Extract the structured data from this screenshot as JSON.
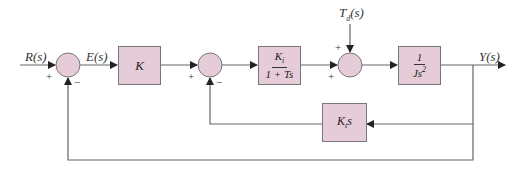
{
  "diagram": {
    "type": "block-diagram",
    "signals": {
      "input": "R(s)",
      "error": "E(s)",
      "disturbance": "T",
      "disturbance_sub": "d",
      "disturbance_arg": "(s)",
      "output": "Y(s)"
    },
    "blocks": {
      "gain": {
        "label": "K"
      },
      "controller": {
        "numerator": "K",
        "numerator_sub": "i",
        "denominator": "1 + Ts"
      },
      "plant": {
        "numerator": "1",
        "denominator": "Js",
        "denominator_sup": "2"
      },
      "rate_feedback": {
        "label": "K",
        "label_sub": "t",
        "label_suffix": "s"
      }
    },
    "summing_junctions": [
      {
        "id": "sum1",
        "signs": {
          "left": "+",
          "bottom": "−"
        }
      },
      {
        "id": "sum2",
        "signs": {
          "left": "+",
          "bottom": "−"
        }
      },
      {
        "id": "sum3",
        "signs": {
          "top": "+",
          "left": "+"
        }
      }
    ],
    "colors": {
      "block_fill": "#e6ccd8",
      "line": "#666666",
      "text": "#333333"
    }
  }
}
